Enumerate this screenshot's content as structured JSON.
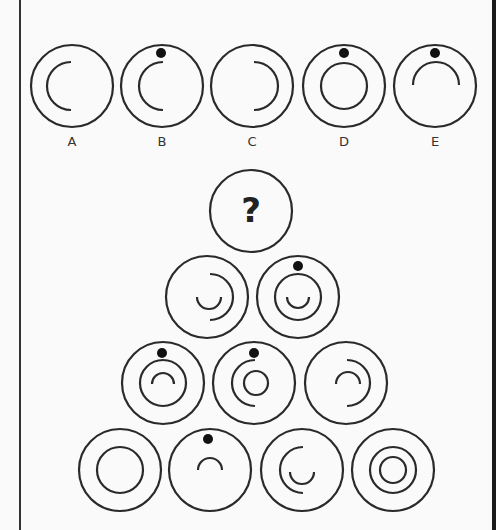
{
  "puzzle": {
    "stroke_color": "#2a2a2a",
    "background": "#fafafa",
    "question_mark": "?",
    "options": [
      {
        "label": "A",
        "cx": 72,
        "cy": 86,
        "dot": false,
        "shapes": [
          {
            "type": "arc",
            "r": 24,
            "from": 45,
            "to": 135,
            "side": "left"
          }
        ]
      },
      {
        "label": "B",
        "cx": 162,
        "cy": 86,
        "dot": true,
        "shapes": [
          {
            "type": "arc",
            "r": 24,
            "side": "left"
          }
        ]
      },
      {
        "label": "C",
        "cx": 252,
        "cy": 86,
        "dot": false,
        "shapes": [
          {
            "type": "arc",
            "r": 24,
            "side": "right"
          }
        ]
      },
      {
        "label": "D",
        "cx": 344,
        "cy": 86,
        "dot": true,
        "shapes": [
          {
            "type": "circle",
            "r": 24
          }
        ]
      },
      {
        "label": "E",
        "cx": 435,
        "cy": 86,
        "dot": true,
        "shapes": [
          {
            "type": "arc",
            "r": 24,
            "side": "top"
          }
        ]
      }
    ],
    "pyramid": {
      "row1": [
        {
          "cell": "question"
        }
      ],
      "row2": [
        {
          "dot": false,
          "shapes": [
            "outer-arc-right",
            "inner-arc-bottom"
          ]
        },
        {
          "dot": true,
          "shapes": [
            "outer-circle",
            "inner-arc-bottom"
          ]
        }
      ],
      "row3": [
        {
          "dot": true,
          "shapes": [
            "outer-circle",
            "inner-arc-top"
          ]
        },
        {
          "dot": true,
          "shapes": [
            "outer-arc-left",
            "inner-circle"
          ]
        },
        {
          "dot": false,
          "shapes": [
            "outer-arc-right",
            "inner-arc-top"
          ]
        }
      ],
      "row4": [
        {
          "dot": false,
          "shapes": [
            "outer-circle"
          ]
        },
        {
          "dot": true,
          "shapes": [
            "inner-arc-top"
          ]
        },
        {
          "dot": false,
          "shapes": [
            "outer-arc-left",
            "inner-arc-bottom"
          ]
        },
        {
          "dot": false,
          "shapes": [
            "outer-circle",
            "inner-circle"
          ]
        }
      ]
    }
  }
}
